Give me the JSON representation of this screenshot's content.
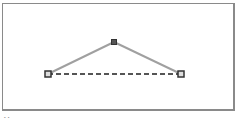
{
  "diagram": {
    "points": [
      {
        "id": "left",
        "x": 48,
        "y": 74,
        "style": "hollow-square"
      },
      {
        "id": "apex",
        "x": 114,
        "y": 42,
        "style": "filled-square"
      },
      {
        "id": "right",
        "x": 181,
        "y": 74,
        "style": "hollow-square"
      }
    ],
    "edges": [
      {
        "from": "left",
        "to": "apex",
        "style": "solid"
      },
      {
        "from": "apex",
        "to": "right",
        "style": "solid"
      },
      {
        "from": "left",
        "to": "right",
        "style": "dashed"
      }
    ],
    "colors": {
      "edge": "#a0a0a0",
      "dashed": "#555555",
      "handle_border": "#333333",
      "handle_fill": "#dddddd",
      "frame": "#8a8a8a"
    }
  },
  "caption": {
    "text": "··"
  }
}
